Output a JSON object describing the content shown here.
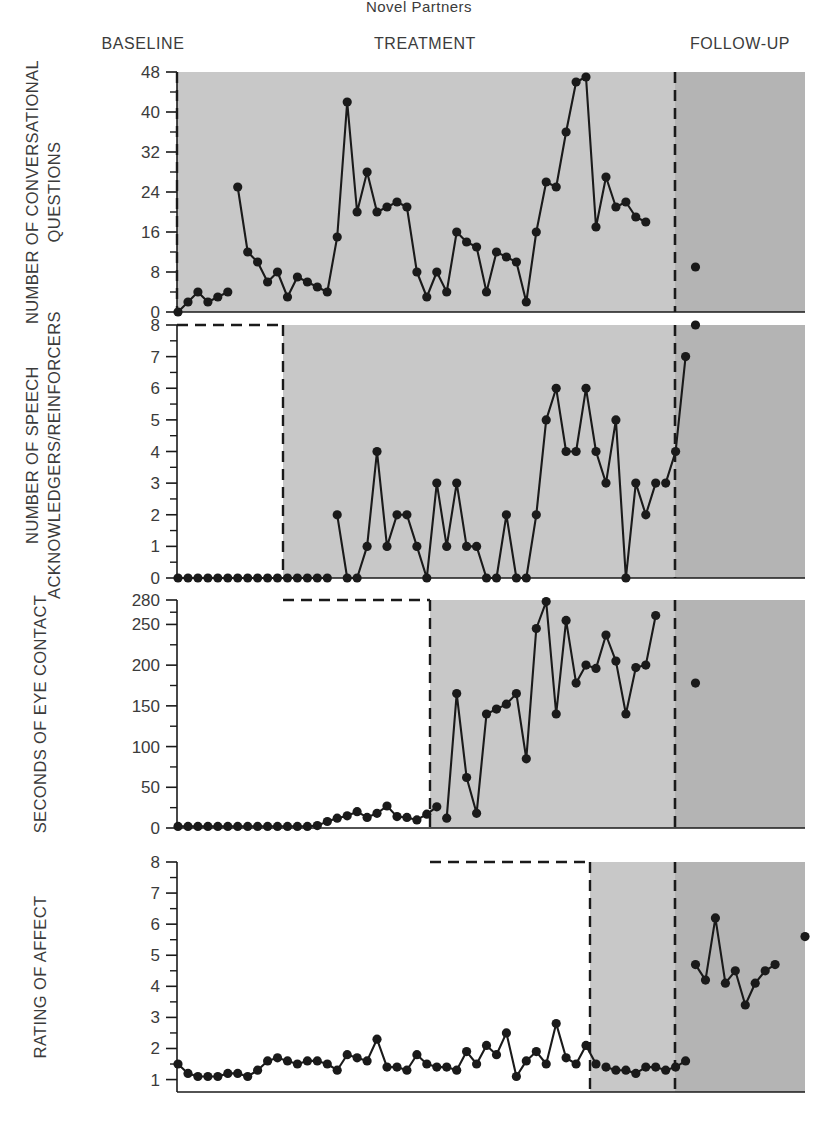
{
  "figure": {
    "title": "Novel Partners",
    "phases": [
      {
        "key": "baseline",
        "label": "BASELINE"
      },
      {
        "key": "treatment",
        "label": "TREATMENT"
      },
      {
        "key": "followup",
        "label": "FOLLOW-UP"
      }
    ],
    "colors": {
      "ink": "#1a1a1a",
      "axis_text": "#3b3b3b",
      "treatment_shade": "#c8c8c8",
      "followup_shade": "#b4b4b4",
      "plot_background": "#ffffff"
    }
  },
  "chart_data": [
    {
      "type": "line",
      "panel": 1,
      "title": "Novel Partners",
      "ylabel": "NUMBER OF CONVERSATIONAL QUESTIONS",
      "xlabel": "",
      "ylim": [
        0,
        48
      ],
      "yticks": [
        0,
        8,
        16,
        24,
        32,
        40,
        48
      ],
      "ytick_labels": [
        "0",
        "8",
        "16",
        "24",
        "32",
        "40",
        "48"
      ],
      "minor_tick_step": 4,
      "grid": false,
      "legend": "none",
      "xlim": [
        0,
        56
      ],
      "phase_boundaries": {
        "treatment_start": 7,
        "followup_start": 50
      },
      "series": [
        {
          "name": "baseline",
          "x": [
            1,
            2,
            3,
            4,
            5,
            6
          ],
          "values": [
            0,
            2,
            4,
            2,
            3,
            4
          ]
        },
        {
          "name": "treatment",
          "x": [
            7,
            8,
            9,
            10,
            11,
            12,
            13,
            14,
            15,
            16,
            17,
            18,
            19,
            20,
            21,
            22,
            23,
            24,
            25,
            26,
            27,
            28,
            29,
            30,
            31,
            32,
            33,
            34,
            35,
            36,
            37,
            38,
            39,
            40,
            41,
            42,
            43,
            44,
            45,
            46,
            47,
            48
          ],
          "values": [
            25,
            12,
            10,
            6,
            8,
            3,
            7,
            6,
            5,
            4,
            15,
            42,
            20,
            28,
            20,
            21,
            22,
            21,
            8,
            3,
            8,
            4,
            16,
            14,
            13,
            4,
            12,
            11,
            10,
            2,
            16,
            26,
            25,
            36,
            46,
            47,
            17,
            27,
            21,
            22,
            19,
            18
          ],
          "note": "values read from the 0-48 axis"
        },
        {
          "name": "followup",
          "x": [
            53
          ],
          "values": [
            9
          ]
        }
      ]
    },
    {
      "type": "line",
      "panel": 2,
      "ylabel": "NUMBER OF SPEECH ACKNOWLEDGERS/REINFORCERS",
      "xlabel": "",
      "ylim": [
        0,
        8
      ],
      "yticks": [
        0,
        1,
        2,
        3,
        4,
        5,
        6,
        7,
        8
      ],
      "ytick_labels": [
        "0",
        "1",
        "2",
        "3",
        "4",
        "5",
        "6",
        "7",
        "8"
      ],
      "grid": false,
      "legend": "none",
      "xlim": [
        0,
        56
      ],
      "phase_boundaries": {
        "treatment_start": 17,
        "followup_start": 50
      },
      "series": [
        {
          "name": "baseline",
          "x": [
            1,
            2,
            3,
            4,
            5,
            6,
            7,
            8,
            9,
            10,
            11,
            12,
            13,
            14,
            15,
            16
          ],
          "values": [
            0,
            0,
            0,
            0,
            0,
            0,
            0,
            0,
            0,
            0,
            0,
            0,
            0,
            0,
            0,
            0
          ]
        },
        {
          "name": "treatment",
          "x": [
            17,
            18,
            19,
            20,
            21,
            22,
            23,
            24,
            25,
            26,
            27,
            28,
            29,
            30,
            31,
            32,
            33,
            34,
            35,
            36,
            37,
            38,
            39,
            40,
            41,
            42,
            43,
            44,
            45,
            46,
            47,
            48,
            49
          ],
          "values": [
            2,
            0,
            0,
            1,
            4,
            1,
            2,
            2,
            1,
            0,
            3,
            1,
            3,
            1,
            1,
            0,
            0,
            2,
            0,
            0,
            2,
            5,
            6,
            4,
            4,
            6,
            4,
            3,
            5,
            0,
            3,
            2,
            3
          ],
          "note": "values read from the 0-8 axis"
        },
        {
          "name": "treatment_tail",
          "x": [
            50,
            51,
            52
          ],
          "values": [
            3,
            4,
            7
          ]
        },
        {
          "name": "followup",
          "x": [
            53
          ],
          "values": [
            8
          ]
        }
      ]
    },
    {
      "type": "line",
      "panel": 3,
      "ylabel": "SECONDS OF EYE CONTACT",
      "xlabel": "",
      "ylim": [
        0,
        280
      ],
      "yticks": [
        0,
        50,
        100,
        150,
        200,
        250,
        280
      ],
      "ytick_labels": [
        "0",
        "50",
        "100",
        "150",
        "200",
        "250",
        "280"
      ],
      "grid": false,
      "legend": "none",
      "xlim": [
        0,
        56
      ],
      "phase_boundaries": {
        "treatment_start": 28,
        "followup_start": 50
      },
      "series": [
        {
          "name": "baseline",
          "x": [
            1,
            2,
            3,
            4,
            5,
            6,
            7,
            8,
            9,
            10,
            11,
            12,
            13,
            14,
            15,
            16,
            17,
            18,
            19,
            20,
            21,
            22,
            23,
            24,
            25,
            26,
            27
          ],
          "values": [
            2,
            2,
            2,
            2,
            2,
            2,
            2,
            2,
            2,
            2,
            2,
            2,
            2,
            2,
            3,
            8,
            12,
            15,
            20,
            13,
            18,
            27,
            14,
            13,
            10,
            17,
            26
          ]
        },
        {
          "name": "treatment",
          "x": [
            28,
            29,
            30,
            31,
            32,
            33,
            34,
            35,
            36,
            37,
            38,
            39,
            40,
            41,
            42,
            43,
            44,
            45,
            46,
            47,
            48,
            49
          ],
          "values": [
            12,
            165,
            62,
            18,
            140,
            146,
            152,
            165,
            85,
            245,
            278,
            140,
            255,
            178,
            200,
            196,
            237,
            205,
            140,
            197,
            200,
            261
          ],
          "note": "values read from the 0-280 axis"
        },
        {
          "name": "followup",
          "x": [
            53
          ],
          "values": [
            178
          ]
        }
      ]
    },
    {
      "type": "line",
      "panel": 4,
      "ylabel": "RATING OF AFFECT",
      "xlabel": "",
      "ylim": [
        0.6,
        8
      ],
      "yticks": [
        1,
        2,
        3,
        4,
        5,
        6,
        7,
        8
      ],
      "ytick_labels": [
        "1",
        "2",
        "3",
        "4",
        "5",
        "6",
        "7",
        "8"
      ],
      "grid": false,
      "legend": "none",
      "xlim": [
        0,
        56
      ],
      "phase_boundaries": {
        "treatment_start": 44,
        "followup_start": 50
      },
      "series": [
        {
          "name": "baseline",
          "x": [
            1,
            2,
            3,
            4,
            5,
            6,
            7,
            8,
            9,
            10,
            11,
            12,
            13,
            14,
            15,
            16,
            17,
            18,
            19,
            20,
            21,
            22,
            23,
            24,
            25,
            26,
            27,
            28,
            29,
            30,
            31,
            32,
            33,
            34,
            35,
            36,
            37,
            38,
            39,
            40,
            41,
            42,
            43
          ],
          "values": [
            1.5,
            1.2,
            1.1,
            1.1,
            1.1,
            1.2,
            1.2,
            1.1,
            1.3,
            1.6,
            1.7,
            1.6,
            1.5,
            1.6,
            1.6,
            1.5,
            1.3,
            1.8,
            1.7,
            1.6,
            2.3,
            1.4,
            1.4,
            1.3,
            1.8,
            1.5,
            1.4,
            1.4,
            1.3,
            1.9,
            1.5,
            2.1,
            1.8,
            2.5,
            1.1,
            1.6,
            1.9,
            1.5,
            2.8,
            1.7,
            1.5,
            2.1,
            1.5
          ]
        },
        {
          "name": "baseline_tail",
          "x": [
            44,
            45,
            46,
            47,
            48,
            49,
            50,
            51,
            52
          ],
          "values": [
            1.4,
            1.3,
            1.3,
            1.2,
            1.4,
            1.4,
            1.3,
            1.4,
            1.6
          ]
        },
        {
          "name": "treatment",
          "x": [
            53,
            54,
            55,
            56,
            57,
            58,
            59,
            60,
            61
          ],
          "values": [
            4.7,
            4.2,
            6.2,
            4.1,
            4.5,
            3.4,
            4.1,
            4.5,
            4.7
          ],
          "note": "values read from the 1-8 axis"
        },
        {
          "name": "followup",
          "x": [
            64
          ],
          "values": [
            5.6
          ]
        }
      ]
    }
  ],
  "axes": {
    "panel1": {
      "ylabel": "NUMBER OF CONVERSATIONAL QUESTIONS",
      "ticks": [
        "48",
        "40",
        "32",
        "24",
        "16",
        "8",
        "0"
      ]
    },
    "panel2": {
      "ylabel": "NUMBER OF SPEECH ACKNOWLEDGERS/REINFORCERS",
      "ticks": [
        "8",
        "7",
        "6",
        "5",
        "4",
        "3",
        "2",
        "1",
        "0"
      ]
    },
    "panel3": {
      "ylabel": "SECONDS OF EYE CONTACT",
      "ticks": [
        "280",
        "250",
        "200",
        "150",
        "100",
        "50",
        "0"
      ]
    },
    "panel4": {
      "ylabel": "RATING OF AFFECT",
      "ticks": [
        "8",
        "7",
        "6",
        "5",
        "4",
        "3",
        "2",
        "1"
      ]
    }
  }
}
